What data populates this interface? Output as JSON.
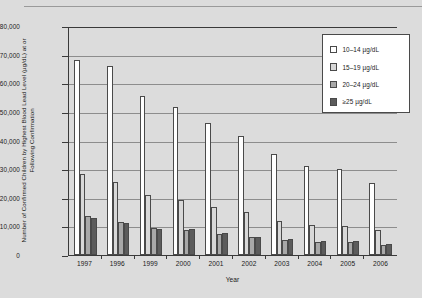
{
  "chart_data": {
    "type": "bar",
    "title": "",
    "xlabel": "Year",
    "ylabel": "Number of Confirmed Children by Highest Blood Lead Level (µg/dL) at or Following Confirmation",
    "categories": [
      "1997",
      "1996",
      "1999",
      "2000",
      "2001",
      "2002",
      "2003",
      "2004",
      "2005",
      "2006"
    ],
    "ylim": [
      0,
      80000
    ],
    "ytick_labels": [
      "80,000",
      "70,000",
      "60,000",
      "50,000",
      "40,000",
      "30,000",
      "20,000",
      "10,000",
      "0"
    ],
    "ytick_values": [
      80000,
      70000,
      60000,
      50000,
      40000,
      30000,
      20000,
      10000,
      0
    ],
    "grid": true,
    "legend_position": "top-right",
    "series": [
      {
        "name": "10–14 µg/dL",
        "color": "#ffffff",
        "values": [
          68000,
          66200,
          55600,
          51700,
          46000,
          41500,
          35300,
          31200,
          30100,
          25200
        ]
      },
      {
        "name": "15–19 µg/dL",
        "color": "#d8d8d8",
        "values": [
          28300,
          25600,
          20800,
          19100,
          16700,
          14900,
          11800,
          10600,
          10100,
          8600
        ]
      },
      {
        "name": "20–24 µg/dL",
        "color": "#a8a8a8",
        "values": [
          13500,
          11400,
          9300,
          8700,
          7300,
          6200,
          5300,
          4500,
          4600,
          3600
        ]
      },
      {
        "name": "≥25 µg/dL",
        "color": "#5c5c5c",
        "values": [
          13000,
          11100,
          9100,
          9100,
          7800,
          6300,
          5700,
          4800,
          4800,
          3900
        ]
      }
    ]
  }
}
